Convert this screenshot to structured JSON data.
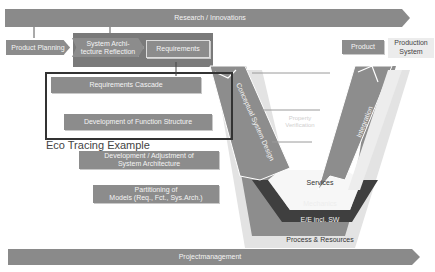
{
  "diagram": {
    "title_bar": "Research / Innovations",
    "bottom_bar": "Projectmanagement",
    "process_chain": [
      {
        "label": "Product Planning"
      },
      {
        "label": "System Archi-\ntecture Reflection"
      },
      {
        "label": "Requirements"
      }
    ],
    "right_labels": {
      "product": "Product",
      "production_system": "Production\nSystem"
    },
    "left_steps": [
      {
        "label": "Requirements  Cascade"
      },
      {
        "label": "Development of Function Structure"
      },
      {
        "label": "Development / Adjustment of\nSystem Architecture"
      },
      {
        "label": "Partitioning of\nModels (Req., Fct., Sys.Arch.)"
      }
    ],
    "highlight_box_caption": "Eco Tracing Example",
    "v_model": {
      "left_arm": "Conceptual System Design",
      "right_arm": "Integration",
      "center": "Property\nVerification",
      "layers": [
        {
          "label": "Services"
        },
        {
          "label": "Mechanics"
        },
        {
          "label": "E/E incl. SW"
        },
        {
          "label": "Process & Resources"
        }
      ]
    },
    "colors": {
      "bar_grey": "#8c8c8c",
      "dark_grey": "#4a4a4a",
      "light_grey": "#e2e2e2",
      "box_outline": "#3a3a3a"
    }
  }
}
